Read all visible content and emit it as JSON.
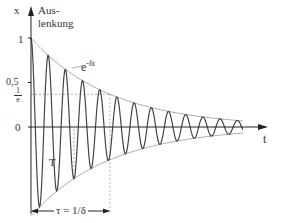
{
  "diagram": {
    "y_axis_label": "x",
    "y_axis_caption_line1": "Aus-",
    "y_axis_caption_line2": "lenkung",
    "x_axis_label": "t",
    "envelope_label_base": "e",
    "envelope_label_exp": "-δt",
    "ticks": {
      "one": "1",
      "half": "0,5",
      "inv_e_num": "1",
      "inv_e_den": "e",
      "zero": "0"
    },
    "period_label": "T",
    "tau_label": "τ = 1/δ",
    "colors": {
      "curve": "#444444",
      "axis": "#222222",
      "envelope": "#999999",
      "dashed": "#888888"
    }
  },
  "chart_data": {
    "type": "line",
    "title": "",
    "xlabel": "t",
    "ylabel": "x (Auslenkung)",
    "series": [
      {
        "name": "x(t) = e^{-δt} cos(ωt)",
        "description": "damped oscillation starting at 1"
      },
      {
        "name": "e^{-δt}",
        "description": "upper envelope"
      },
      {
        "name": "-e^{-δt}",
        "description": "lower envelope"
      }
    ],
    "y_ticks": [
      "1",
      "0,5",
      "1/e",
      "0"
    ],
    "annotations": [
      "T (period)",
      "τ = 1/δ (decay time, where envelope = 1/e)"
    ],
    "approx_cycles_shown": 13,
    "ylim": [
      -1,
      1
    ]
  }
}
